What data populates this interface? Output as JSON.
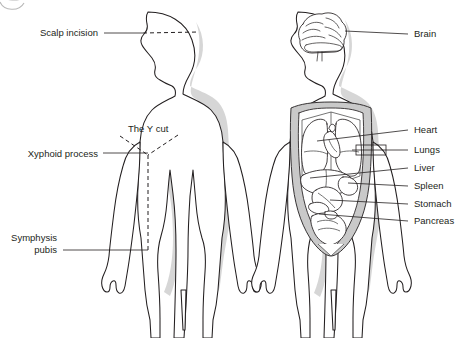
{
  "figure": {
    "background_color": "#ffffff",
    "line_color": "#231f20",
    "cavity_fill": "#c9c9c9",
    "shadow_color": "#cfcfcf",
    "width": 462,
    "height": 338
  },
  "left_figure": {
    "name": "Incision lines figure (anterior body with Y incision)",
    "labels": [
      {
        "id": "scalp-incision",
        "text": "Scalp incision",
        "text_x": 98,
        "text_y": 36,
        "leader": "M 104 33 L 143 33",
        "align": "end"
      },
      {
        "id": "y-cut",
        "text": "The Y cut",
        "text_x": 128,
        "text_y": 129,
        "leader": "",
        "align": "start"
      },
      {
        "id": "xyphoid-process",
        "text": "Xyphoid process",
        "text_x": 98,
        "text_y": 157,
        "leader": "M 103 153 L 148 153",
        "align": "end"
      },
      {
        "id": "symphysis-pubis-line1",
        "text": "Symphysis",
        "text_x": 57,
        "text_y": 241,
        "leader": "",
        "align": "end"
      },
      {
        "id": "symphysis-pubis-line2",
        "text": "pubis",
        "text_x": 57,
        "text_y": 253,
        "leader": "M 63 250 L 148 250",
        "align": "end"
      }
    ],
    "incisions": [
      {
        "id": "scalp-dashed",
        "desc": "horizontal dashed scalp incision across cranium",
        "path": "M 143 33 L 199 32"
      },
      {
        "id": "y-left-arm",
        "desc": "dashed left shoulder arm of Y incision",
        "path": "M 120 136 L 148 155"
      },
      {
        "id": "y-right-arm",
        "desc": "dashed right shoulder arm of Y incision",
        "path": "M 178 135 L 148 155"
      },
      {
        "id": "y-midline",
        "desc": "dashed vertical midline to pubis",
        "path": "M 148 155 L 148 252"
      }
    ]
  },
  "right_figure": {
    "name": "Organs figure (anterior body with exposed organs)",
    "labels": [
      {
        "id": "brain",
        "text": "Brain",
        "text_x": 414,
        "text_y": 37,
        "leader": "M 345 31 L 408 34",
        "align": "start"
      },
      {
        "id": "heart",
        "text": "Heart",
        "text_x": 414,
        "text_y": 133,
        "leader": "M 317 141 L 408 130",
        "align": "start"
      },
      {
        "id": "lungs",
        "text": "Lungs",
        "text_x": 414,
        "text_y": 152,
        "leader": "M 356 150 L 408 150",
        "align": "start"
      },
      {
        "id": "liver",
        "text": "Liver",
        "text_x": 414,
        "text_y": 170,
        "leader": "M 310 176 L 408 168",
        "align": "start"
      },
      {
        "id": "spleen",
        "text": "Spleen",
        "text_x": 414,
        "text_y": 188,
        "leader": "M 348 182 L 408 186",
        "align": "start"
      },
      {
        "id": "stomach",
        "text": "Stomach",
        "text_x": 414,
        "text_y": 206,
        "leader": "M 330 200 L 408 204",
        "align": "start"
      },
      {
        "id": "pancreas",
        "text": "Pancreas",
        "text_x": 414,
        "text_y": 223,
        "leader": "M 319 214 L 408 221",
        "align": "start"
      }
    ],
    "organs": [
      "brain",
      "heart",
      "lungs",
      "liver",
      "spleen",
      "stomach",
      "pancreas",
      "intestines",
      "ribcage",
      "diaphragm"
    ]
  },
  "decoration": {
    "corner_mark": "partial circular crop mark, top-left"
  }
}
